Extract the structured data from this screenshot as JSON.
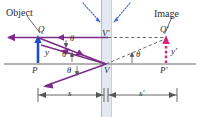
{
  "figure": {
    "type": "optics-ray-diagram",
    "background": "#ffffff"
  },
  "colors": {
    "object_arrow": "#1f4fc4",
    "image_arrow": "#e0207f",
    "ray": "#7d2b8b",
    "axis": "#9a9a9a",
    "mirror_band": "#dfe4ef",
    "mirror_line": "#b9bfcb",
    "dashed_guide": "#555555",
    "normal_hint": "#3763d6",
    "dimension": "#555555",
    "text": "#2b2b2b"
  },
  "labels": {
    "object": "Object",
    "image": "Image",
    "point_Q": "Q",
    "point_Q_prime": "Q′",
    "point_P": "P",
    "point_P_prime": "P′",
    "point_V": "V",
    "point_V_prime": "V′",
    "height_y": "y",
    "height_y_prime": "y′",
    "theta_1": "θ",
    "theta_2": "θ",
    "theta_3": "θ",
    "theta_4": "θ",
    "distance_s": "s",
    "distance_s_prime": "s′"
  },
  "geometry": {
    "axis_y": 64,
    "mirror_x_left": 101,
    "mirror_x_right": 112,
    "object_base_x": 38,
    "object_tip_y": 38,
    "image_base_x": 166,
    "image_tip_y": 38,
    "vertex_x": 106,
    "vertex_prime_y": 38
  },
  "dimensions": {
    "s_label": "s",
    "s_prime_label": "s′",
    "s_start_x": 38,
    "s_end_x": 104,
    "s_prime_start_x": 108,
    "s_prime_end_x": 166,
    "baseline_y": 95
  }
}
